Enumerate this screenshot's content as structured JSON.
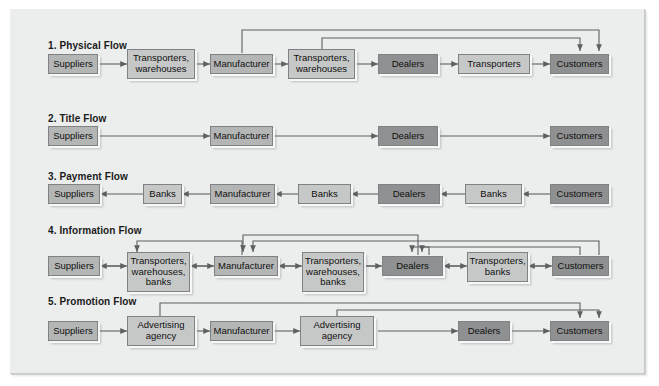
{
  "diagram": {
    "title_text": "Marketing channel flows",
    "palette": {
      "page_bg": "#eceded",
      "outer_bg": "#ffffff",
      "tone_mid": "#b4b6b6",
      "tone_dark": "#8e9091",
      "tone_light": "#c6c8c8",
      "line": "#5d5f61",
      "text": "#10100f"
    },
    "rows": [
      {
        "id": "physical-flow",
        "title": "1. Physical Flow",
        "nodes": [
          {
            "label": "Suppliers",
            "tone": "tone-mid"
          },
          {
            "label": "Transporters,\nwarehouses",
            "tone": "tone-light"
          },
          {
            "label": "Manufacturer",
            "tone": "tone-mid"
          },
          {
            "label": "Transporters,\nwarehouses",
            "tone": "tone-light"
          },
          {
            "label": "Dealers",
            "tone": "tone-dark"
          },
          {
            "label": "Transporters",
            "tone": "tone-light"
          },
          {
            "label": "Customers",
            "tone": "tone-dark"
          }
        ]
      },
      {
        "id": "title-flow",
        "title": "2. Title Flow",
        "nodes": [
          {
            "label": "Suppliers",
            "tone": "tone-mid"
          },
          {
            "label": "Manufacturer",
            "tone": "tone-mid"
          },
          {
            "label": "Dealers",
            "tone": "tone-dark"
          },
          {
            "label": "Customers",
            "tone": "tone-dark"
          }
        ]
      },
      {
        "id": "payment-flow",
        "title": "3. Payment Flow",
        "nodes": [
          {
            "label": "Suppliers",
            "tone": "tone-mid"
          },
          {
            "label": "Banks",
            "tone": "tone-light"
          },
          {
            "label": "Manufacturer",
            "tone": "tone-mid"
          },
          {
            "label": "Banks",
            "tone": "tone-light"
          },
          {
            "label": "Dealers",
            "tone": "tone-dark"
          },
          {
            "label": "Banks",
            "tone": "tone-light"
          },
          {
            "label": "Customers",
            "tone": "tone-dark"
          }
        ]
      },
      {
        "id": "information-flow",
        "title": "4. Information Flow",
        "nodes": [
          {
            "label": "Suppliers",
            "tone": "tone-mid"
          },
          {
            "label": "Transporters,\nwarehouses,\nbanks",
            "tone": "tone-light"
          },
          {
            "label": "Manufacturer",
            "tone": "tone-mid"
          },
          {
            "label": "Transporters,\nwarehouses,\nbanks",
            "tone": "tone-light"
          },
          {
            "label": "Dealers",
            "tone": "tone-dark"
          },
          {
            "label": "Transporters,\nbanks",
            "tone": "tone-light"
          },
          {
            "label": "Customers",
            "tone": "tone-dark"
          }
        ]
      },
      {
        "id": "promotion-flow",
        "title": "5. Promotion Flow",
        "nodes": [
          {
            "label": "Suppliers",
            "tone": "tone-mid"
          },
          {
            "label": "Advertising\nagency",
            "tone": "tone-light"
          },
          {
            "label": "Manufacturer",
            "tone": "tone-mid"
          },
          {
            "label": "Advertising\nagency",
            "tone": "tone-light"
          },
          {
            "label": "Dealers",
            "tone": "tone-dark"
          },
          {
            "label": "Customers",
            "tone": "tone-dark"
          }
        ]
      }
    ]
  }
}
